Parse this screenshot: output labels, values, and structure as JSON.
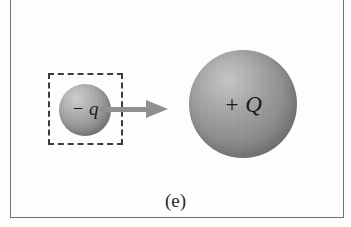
{
  "figure": {
    "caption": "(e)",
    "background_color": "#fdfdfd",
    "frame_color": "#6f7175"
  },
  "dashed_box": {
    "name": "dashed-selection-box",
    "border_style": "dashed",
    "border_color": "#3a3c40"
  },
  "small_charge": {
    "label": "− q",
    "sign": "negative",
    "symbol": "q",
    "sphere_color": "#9b9b9b"
  },
  "large_charge": {
    "label": "+ Q",
    "sign": "positive",
    "symbol": "Q",
    "sphere_color": "#9b9b9b"
  },
  "arrow": {
    "name": "motion-arrow",
    "direction": "right",
    "color": "#8d8f93"
  }
}
